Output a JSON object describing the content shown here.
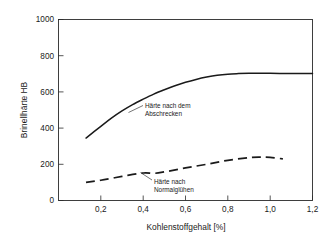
{
  "chart_data": {
    "type": "line",
    "title": "",
    "xlabel": "Kohlenstoffgehalt   [%]",
    "ylabel": "Brinellhärte  HB",
    "xlim": [
      0.0,
      1.2
    ],
    "ylim": [
      0,
      1000
    ],
    "xticks": [
      "0,2",
      "0,4",
      "0,6",
      "0,8",
      "1,0",
      "1,2"
    ],
    "xtick_values": [
      0.2,
      0.4,
      0.6,
      0.8,
      1.0,
      1.2
    ],
    "yticks": [
      "0",
      "200",
      "400",
      "600",
      "800",
      "1000"
    ],
    "ytick_values": [
      0,
      200,
      400,
      600,
      800,
      1000
    ],
    "grid": false,
    "legend": "none",
    "series": [
      {
        "name": "Härte nach dem Abschrecken",
        "style": "solid",
        "x": [
          0.13,
          0.2,
          0.25,
          0.3,
          0.35,
          0.4,
          0.45,
          0.5,
          0.55,
          0.6,
          0.65,
          0.7,
          0.75,
          0.8,
          0.85,
          0.9,
          0.95,
          1.0,
          1.05,
          1.1,
          1.15,
          1.2
        ],
        "y": [
          345,
          410,
          455,
          495,
          530,
          560,
          588,
          612,
          634,
          653,
          669,
          682,
          692,
          698,
          701,
          703,
          703,
          703,
          702,
          702,
          702,
          702
        ]
      },
      {
        "name": "Härte nach Normalglühen",
        "style": "dashed",
        "x": [
          0.13,
          0.2,
          0.3,
          0.4,
          0.45,
          0.5,
          0.6,
          0.7,
          0.8,
          0.9,
          0.95,
          1.0,
          1.06
        ],
        "y": [
          100,
          112,
          133,
          152,
          150,
          158,
          180,
          200,
          222,
          237,
          240,
          238,
          230
        ]
      }
    ],
    "annotations": [
      {
        "name": "annotation-quenched",
        "line1": "Härte nach dem",
        "line2": "Abschrecken"
      },
      {
        "name": "annotation-normalized",
        "line1": "Härte nach",
        "line2": "Normalglühen"
      }
    ],
    "colors": {
      "line": "#1a1a1a",
      "axis": "#2b2b2b",
      "background": "#ffffff"
    }
  }
}
